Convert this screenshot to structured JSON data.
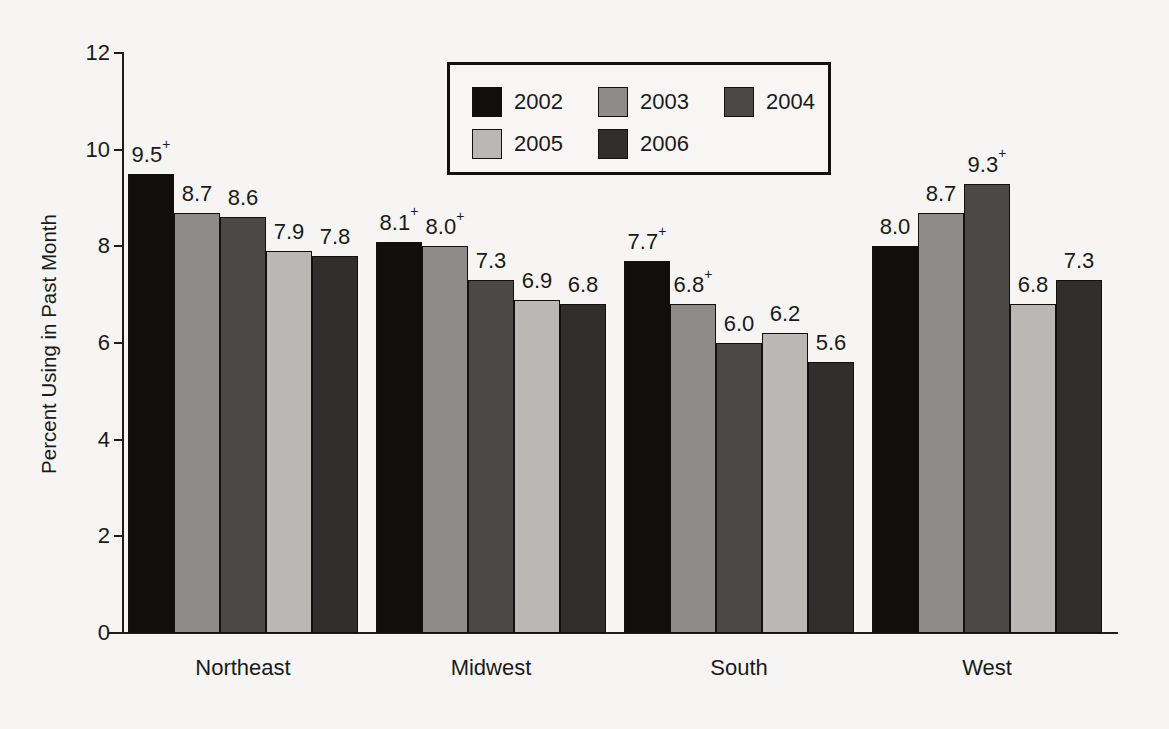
{
  "chart_data": {
    "type": "bar",
    "title": "",
    "xlabel": "",
    "ylabel": "Percent Using in Past Month",
    "ylim": [
      0,
      12
    ],
    "yticks": [
      0,
      2,
      4,
      6,
      8,
      10,
      12
    ],
    "grid": false,
    "legend_position": "top-center",
    "categories": [
      "Northeast",
      "Midwest",
      "South",
      "West"
    ],
    "series": [
      {
        "name": "2002",
        "color": "#100f0e",
        "values": [
          9.5,
          8.1,
          7.7,
          8.0
        ],
        "labels": [
          "9.5",
          "8.1",
          "7.7",
          "8.0"
        ],
        "marks": [
          "+",
          "+",
          "+",
          ""
        ]
      },
      {
        "name": "2003",
        "color": "#8d8c8a",
        "values": [
          8.7,
          8.0,
          6.8,
          8.7
        ],
        "labels": [
          "8.7",
          "8.0",
          "6.8",
          "8.7"
        ],
        "marks": [
          "",
          "+",
          "+",
          ""
        ]
      },
      {
        "name": "2004",
        "color": "#4a4947",
        "values": [
          8.6,
          7.3,
          6.0,
          9.3
        ],
        "labels": [
          "8.6",
          "7.3",
          "6.0",
          "9.3"
        ],
        "marks": [
          "",
          "",
          "",
          "+"
        ]
      },
      {
        "name": "2005",
        "color": "#b9b8b5",
        "values": [
          7.9,
          6.9,
          6.2,
          6.8
        ],
        "labels": [
          "7.9",
          "6.9",
          "6.2",
          "6.8"
        ],
        "marks": [
          "",
          "",
          "",
          ""
        ]
      },
      {
        "name": "2006",
        "color": "#302f2d",
        "values": [
          7.8,
          6.8,
          5.6,
          7.3
        ],
        "labels": [
          "7.8",
          "6.8",
          "5.6",
          "7.3"
        ],
        "marks": [
          "",
          "",
          "",
          ""
        ]
      }
    ],
    "footnote_symbol": "+"
  },
  "legend": {
    "entries": [
      "2002",
      "2003",
      "2004",
      "2005",
      "2006"
    ]
  },
  "axis": {
    "y_title": "Percent Using in Past Month",
    "y_tick_labels": [
      "12",
      "10",
      "8",
      "6",
      "4",
      "2",
      "0"
    ]
  }
}
